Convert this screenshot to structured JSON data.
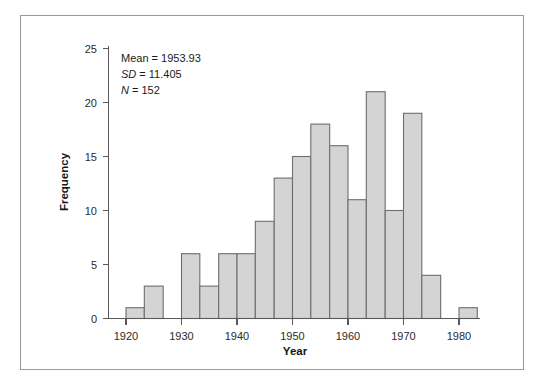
{
  "figure": {
    "background_color": "#ffffff",
    "frame_color": "#9a9a9a",
    "bar_fill_color": "#d4d4d4",
    "bar_edge_color": "#6e6e70",
    "axis_color": "#59595b"
  },
  "annotation": {
    "mean_label": "Mean = 1953.93",
    "sd_label_italic": "SD",
    "sd_label_rest": " = 11.405",
    "n_label_italic": "N",
    "n_label_rest": " = 152"
  },
  "axes": {
    "x_title": "Year",
    "y_title": "Frequency",
    "x_ticks": [
      "1920",
      "1930",
      "1940",
      "1950",
      "1960",
      "1970",
      "1980"
    ],
    "y_ticks": [
      "0",
      "5",
      "10",
      "15",
      "20",
      "25"
    ]
  },
  "chart_data": {
    "type": "bar",
    "title": "",
    "subtitle": "",
    "xlabel": "Year",
    "ylabel": "Frequency",
    "xlim": [
      1916,
      1984
    ],
    "ylim": [
      0,
      26
    ],
    "grid": false,
    "legend": null,
    "bin_width": 3.33,
    "statistics": {
      "mean": 1953.93,
      "sd": 11.405,
      "n": 152
    },
    "bins": [
      {
        "x0": 1920.0,
        "x1": 1923.3,
        "value": 1
      },
      {
        "x0": 1923.3,
        "x1": 1926.7,
        "value": 3
      },
      {
        "x0": 1926.7,
        "x1": 1930.0,
        "value": 0
      },
      {
        "x0": 1930.0,
        "x1": 1933.3,
        "value": 6
      },
      {
        "x0": 1933.3,
        "x1": 1936.7,
        "value": 3
      },
      {
        "x0": 1936.7,
        "x1": 1940.0,
        "value": 6
      },
      {
        "x0": 1940.0,
        "x1": 1943.3,
        "value": 6
      },
      {
        "x0": 1943.3,
        "x1": 1946.7,
        "value": 9
      },
      {
        "x0": 1946.7,
        "x1": 1950.0,
        "value": 13
      },
      {
        "x0": 1950.0,
        "x1": 1953.3,
        "value": 15
      },
      {
        "x0": 1953.3,
        "x1": 1956.7,
        "value": 18
      },
      {
        "x0": 1956.7,
        "x1": 1960.0,
        "value": 16
      },
      {
        "x0": 1960.0,
        "x1": 1963.3,
        "value": 11
      },
      {
        "x0": 1963.3,
        "x1": 1966.7,
        "value": 21
      },
      {
        "x0": 1966.7,
        "x1": 1970.0,
        "value": 10
      },
      {
        "x0": 1970.0,
        "x1": 1973.3,
        "value": 19
      },
      {
        "x0": 1973.3,
        "x1": 1976.7,
        "value": 4
      },
      {
        "x0": 1976.7,
        "x1": 1980.0,
        "value": 0
      },
      {
        "x0": 1980.0,
        "x1": 1983.3,
        "value": 1
      }
    ],
    "categories": [
      "1920.0",
      "1923.3",
      "1926.7",
      "1930.0",
      "1933.3",
      "1936.7",
      "1940.0",
      "1943.3",
      "1946.7",
      "1950.0",
      "1953.3",
      "1956.7",
      "1960.0",
      "1963.3",
      "1966.7",
      "1970.0",
      "1973.3",
      "1976.7",
      "1980.0"
    ],
    "values": [
      1,
      3,
      0,
      6,
      3,
      6,
      6,
      9,
      13,
      15,
      18,
      16,
      11,
      21,
      10,
      19,
      4,
      0,
      1
    ]
  }
}
